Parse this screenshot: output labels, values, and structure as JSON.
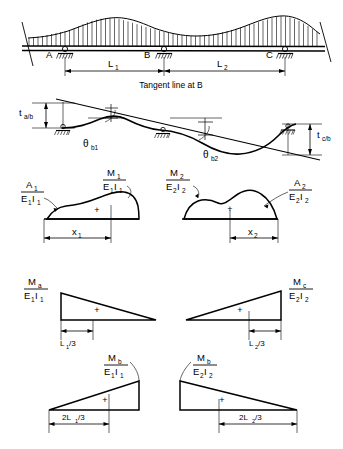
{
  "figure": {
    "caption": "Tangent line at B",
    "stroke_color": "#000000",
    "background_color": "#ffffff"
  },
  "panel_beam": {
    "name": "loaded-continuous-beam",
    "supports": [
      {
        "label": "A",
        "type": "pin-support"
      },
      {
        "label": "B",
        "type": "roller-support"
      },
      {
        "label": "C",
        "type": "roller-support"
      }
    ],
    "load": "distributed-load-hatching",
    "dimensions": [
      {
        "label": "L",
        "sub": "1"
      },
      {
        "label": "L",
        "sub": "2"
      }
    ]
  },
  "panel_deflection": {
    "name": "deflected-shape-with-tangent",
    "caption": "Tangent line at B",
    "deviations": [
      {
        "label": "t",
        "sub": "a/b"
      },
      {
        "label": "t",
        "sub": "c/b"
      }
    ],
    "angles": [
      {
        "symbol": "θ",
        "sub": "b1"
      },
      {
        "symbol": "θ",
        "sub": "b2"
      }
    ]
  },
  "panel_mei_real": {
    "name": "real-moment-diagrams",
    "left": {
      "area_label": "A",
      "area_sub": "1",
      "area_den": "E",
      "area_den_sub": "1",
      "area_den2": "I",
      "area_den2_sub": "1",
      "moment_label": "M",
      "moment_sub": "1",
      "moment_den": "E",
      "moment_den_sub": "1",
      "moment_den2": "I",
      "moment_den2_sub": "1",
      "sign": "+",
      "centroid_label": "x",
      "centroid_sub": "1"
    },
    "right": {
      "area_label": "A",
      "area_sub": "2",
      "area_den": "E",
      "area_den_sub": "2",
      "area_den2": "I",
      "area_den2_sub": "2",
      "moment_label": "M",
      "moment_sub": "2",
      "moment_den": "E",
      "moment_den_sub": "2",
      "moment_den2": "I",
      "moment_den2_sub": "2",
      "sign": "+",
      "centroid_label": "x",
      "centroid_sub": "2"
    }
  },
  "panel_mei_end": {
    "name": "end-moment-diagrams",
    "left": {
      "moment_label": "M",
      "moment_sub": "a",
      "den": "E",
      "den_sub": "1",
      "den2": "I",
      "den2_sub": "1",
      "sign": "+",
      "centroid_text": "L",
      "centroid_sub": "1",
      "centroid_tail": "/3"
    },
    "right": {
      "moment_label": "M",
      "moment_sub": "c",
      "den": "E",
      "den_sub": "2",
      "den2": "I",
      "den2_sub": "2",
      "sign": "+",
      "centroid_text": "L",
      "centroid_sub": "2",
      "centroid_tail": "/3"
    }
  },
  "panel_mei_b": {
    "name": "interior-support-moment-diagrams",
    "left": {
      "moment_label": "M",
      "moment_sub": "b",
      "den": "E",
      "den_sub": "1",
      "den2": "I",
      "den2_sub": "1",
      "sign": "+",
      "centroid_head": "2L",
      "centroid_sub": "1",
      "centroid_tail": "/3"
    },
    "right": {
      "moment_label": "M",
      "moment_sub": "b",
      "den": "E",
      "den_sub": "2",
      "den2": "I",
      "den2_sub": "2",
      "sign": "+",
      "centroid_head": "2L",
      "centroid_sub": "2",
      "centroid_tail": "/3"
    }
  }
}
